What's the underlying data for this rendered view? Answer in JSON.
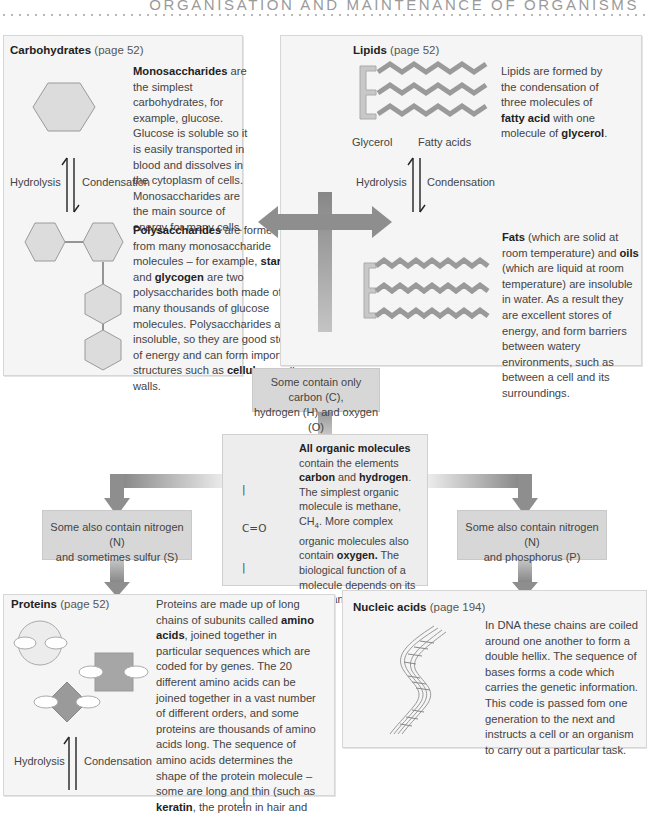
{
  "header": {
    "running_title": "ORGANISATION AND MAINTENANCE OF ORGANISMS"
  },
  "carbohydrates": {
    "title_bold": "Carbohydrates",
    "title_ref": " (page 52)",
    "mono": {
      "term": "Monosaccharides",
      "text": " are the simplest carbohydrates, for example, glucose. Glucose is soluble so it is easily transported in blood and dissolves in the cytoplasm of cells. Monosaccharides are the main source of energy for many cells."
    },
    "hydrolysis_label": "Hydrolysis",
    "condensation_label": "Condensation",
    "poly": {
      "term": "Polysaccharides",
      "t1": " are formed from many monosaccharide molecules – for example, ",
      "b1": "starch",
      "t2": " and ",
      "b2": "glycogen",
      "t3": " are two polysaccharides both made of many thousands of glucose molecules. Polysaccharides are insoluble, so they are good stores of energy and can form important structures such as ",
      "b3": "cellulose",
      "t4": " cell walls."
    }
  },
  "lipids": {
    "title_bold": "Lipids",
    "title_ref": " (page 52)",
    "intro": {
      "t1": "Lipids are formed by the condensation of three molecules of ",
      "b1": "fatty acid",
      "t2": " with one molecule of ",
      "b2": "glycerol",
      "t3": "."
    },
    "glycerol_label": "Glycerol",
    "fatty_acids_label": "Fatty acids",
    "hydrolysis_label": "Hydrolysis",
    "condensation_label": "Condensation",
    "fats": {
      "b1": "Fats",
      "t1": " (which are solid at room temperature) and ",
      "b2": "oils",
      "t2": " (which are liquid at room temperature) are insoluble in water. As a result they are excellent stores of energy, and form barriers between watery environments, such as between a cell and its surroundings."
    }
  },
  "chon_box": {
    "line1": "Some contain only carbon (C),",
    "line2": "hydrogen (H) and oxygen (O)"
  },
  "center": {
    "b1": "All organic molecules",
    "t1": " contain the elements ",
    "b2": "carbon",
    "t2": " and ",
    "b3": "hydrogen",
    "t3": ". The simplest organic molecule is methane, CH",
    "sub": "4",
    "t4": ". More complex organic molecules also contain ",
    "b4": "oxygen.",
    "t5": " The biological function of a molecule depends on its shape and structure.",
    "formula": [
      "   |",
      "   C=O",
      "   |",
      "H-C-O",
      "   |",
      "H-C-OH",
      "   |",
      "H-C-H",
      "   |"
    ]
  },
  "ns_box": {
    "line1": "Some also contain nitrogen (N)",
    "line2": "and sometimes sulfur (S)"
  },
  "np_box": {
    "line1": "Some also contain nitrogen (N)",
    "line2": "and phosphorus (P)"
  },
  "proteins": {
    "title_bold": "Proteins",
    "title_ref": " (page 52)",
    "t1": "Proteins are made up of long chains of subunits called ",
    "b1": "amino acids",
    "t2": ", joined together in particular sequences which are coded for by genes. The 20 different amino acids can be joined together in a vast number of different orders, and some proteins are thousands of amino acids long. The sequence of amino acids determines the shape of the protein molecule – some are long and thin (such as ",
    "b2": "keratin",
    "t3": ", the protein in hair and",
    "hydrolysis_label": "Hydrolysis",
    "condensation_label": "Condensation"
  },
  "nucleic": {
    "title_bold": "Nucleic acids",
    "title_ref": " (page 194)",
    "text": "In DNA these chains are coiled around one another to form a double hellix. The sequence of bases forms a code which carries the genetic information. This code is passed fom one generation to the next and instructs a cell or an organism to carry out a particular task."
  },
  "colors": {
    "panel_bg": "#f5f5f5",
    "box_grey": "#d7d7d7",
    "arrow_grey": "#8c8c8c",
    "shape_fill": "#dcdcdc",
    "shape_dark": "#9a9a9a"
  }
}
